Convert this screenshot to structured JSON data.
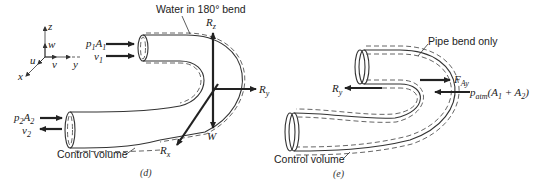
{
  "figure_d": {
    "caption": "(d)",
    "title_label": "Water in 180° bend",
    "control_volume_label": "Control volume",
    "axes": {
      "z": "z",
      "w": "w",
      "u": "u",
      "v": "v",
      "x": "x",
      "y": "y"
    },
    "inlet": {
      "force": "p",
      "force_sub": "1",
      "area": "A",
      "area_sub": "1",
      "velocity": "v",
      "velocity_sub": "1"
    },
    "outlet": {
      "force": "p",
      "force_sub": "2",
      "area": "A",
      "area_sub": "2",
      "velocity": "v",
      "velocity_sub": "2"
    },
    "reactions": {
      "Rz": "R",
      "Rz_sub": "z",
      "Ry": "R",
      "Ry_sub": "y",
      "Rx": "R",
      "Rx_sub": "x",
      "W": "W"
    }
  },
  "figure_e": {
    "caption": "(e)",
    "title_label": "Pipe bend only",
    "control_volume_label": "Control volume",
    "forces": {
      "Ry": "R",
      "Ry_sub": "y",
      "FAy": "F",
      "FAy_sub": "Ay",
      "patm": "p",
      "patm_sub": "atm",
      "patm_args": "(A",
      "a1_sub": "1",
      "plus": " + A",
      "a2_sub": "2",
      "close": ")"
    }
  },
  "colors": {
    "ink": "#222222",
    "background": "#ffffff"
  }
}
